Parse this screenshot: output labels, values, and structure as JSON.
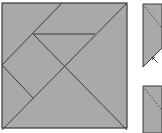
{
  "diagram": {
    "title": "",
    "type": "tangram",
    "colors": {
      "fill": "#a9a9a9",
      "stroke": "#3a3a3a",
      "background": "#ffffff",
      "dashed": "#2a2a2a"
    },
    "main_square": {
      "x": 2,
      "y": 3,
      "size": 125
    },
    "cut_lines": [
      {
        "id": "top-mid-to-left-mid",
        "x1": 62,
        "y1": 3,
        "x2": 2,
        "y2": 65
      },
      {
        "id": "main-diagonal",
        "x1": 127,
        "y1": 3,
        "x2": 2,
        "y2": 130
      },
      {
        "id": "horizontal-inner",
        "x1": 33,
        "y1": 34,
        "x2": 95,
        "y2": 34
      },
      {
        "id": "inner-to-bottom-right",
        "x1": 33,
        "y1": 34,
        "x2": 127,
        "y2": 130
      },
      {
        "id": "left-mid-to-inner",
        "x1": 2,
        "y1": 65,
        "x2": 33,
        "y2": 98
      }
    ],
    "side_pieces": [
      {
        "id": "piece-top",
        "points": "143,4 162,4 162,48 143,67",
        "dashed": {
          "x1": 145,
          "y1": 7,
          "x2": 162,
          "y2": 28
        },
        "arrow": {
          "x": 152,
          "y": 57
        }
      },
      {
        "id": "piece-bottom",
        "points": "143,86 162,86 162,133 143,133",
        "dashed": {
          "x1": 145,
          "y1": 89,
          "x2": 162,
          "y2": 110
        }
      }
    ]
  }
}
